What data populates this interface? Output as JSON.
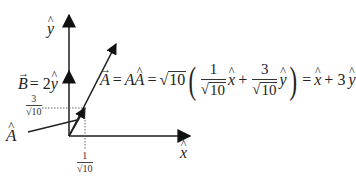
{
  "diagram": {
    "type": "vector-decomposition",
    "axes": {
      "x_label": "x̂",
      "y_label": "ŷ",
      "line_color": "#555555"
    },
    "vectors": [
      {
        "name": "B",
        "label": "B⃗ = 2ŷ",
        "expression": "2ŷ",
        "color": "#111111"
      },
      {
        "name": "A",
        "label": "A⃗",
        "expression": "x̂ + 3ŷ",
        "color": "#111111"
      },
      {
        "name": "A_hat",
        "label": "Â",
        "expression": "(1/√10) x̂ + (3/√10) ŷ",
        "color": "#111111"
      }
    ],
    "ticks": {
      "y_component": {
        "numerator": "3",
        "denominator": "√10"
      },
      "x_component": {
        "numerator": "1",
        "denominator": "√10"
      }
    },
    "labels": {
      "y_hat": "y",
      "x_hat": "x",
      "b_vector_lhs": "B",
      "b_vector_rhs": "= 2",
      "b_vector_unit": "y",
      "a_hat": "A"
    },
    "equation": {
      "lhs": "A",
      "eq1": "=",
      "mag": "A",
      "unit": "A",
      "eq2": "=",
      "sqrt_arg": "10",
      "frac1_num": "1",
      "frac1_den_arg": "10",
      "term1_unit": "x",
      "plus1": "+",
      "frac2_num": "3",
      "frac2_den_arg": "10",
      "term2_unit": "y",
      "eq3": "=",
      "result_unit1": "x",
      "plus2": "+ 3",
      "result_unit2": "y",
      "radical": "√"
    }
  }
}
